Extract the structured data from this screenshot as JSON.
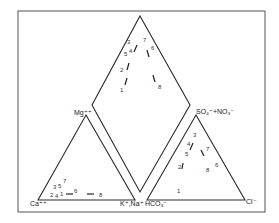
{
  "figure": {
    "type": "Piper trilinear diagram",
    "corner_labels": {
      "cation_left": "Ca⁺⁺",
      "cation_right": "K⁺,Na⁺",
      "cation_apex": "Mg⁺⁺",
      "anion_left": "HCO₃⁻",
      "anion_right": "Cl⁻",
      "anion_apex": "SO₄⁼+NO₃⁻"
    },
    "diamond_points": [
      {
        "label": "1",
        "x": 123,
        "y": 90
      },
      {
        "label": "2",
        "x": 121,
        "y": 70
      },
      {
        "label": "3",
        "x": 128,
        "y": 42
      },
      {
        "label": "5",
        "x": 124,
        "y": 54
      },
      {
        "label": "4",
        "x": 130,
        "y": 52
      },
      {
        "label": "7",
        "x": 145,
        "y": 40
      },
      {
        "label": "6",
        "x": 152,
        "y": 48
      },
      {
        "label": "8",
        "x": 160,
        "y": 87
      }
    ],
    "cation_points": [
      {
        "label": "3",
        "x": 55,
        "y": 187
      },
      {
        "label": "5",
        "x": 60,
        "y": 186
      },
      {
        "label": "7",
        "x": 65,
        "y": 181
      },
      {
        "label": "2",
        "x": 52,
        "y": 195
      },
      {
        "label": "4",
        "x": 57,
        "y": 196
      },
      {
        "label": "1",
        "x": 61,
        "y": 195
      },
      {
        "label": "6",
        "x": 75,
        "y": 193
      },
      {
        "label": "8",
        "x": 101,
        "y": 196
      }
    ],
    "anion_points": [
      {
        "label": "3",
        "x": 194,
        "y": 135
      },
      {
        "label": "4",
        "x": 188,
        "y": 144
      },
      {
        "label": "5",
        "x": 186,
        "y": 154
      },
      {
        "label": "7",
        "x": 207,
        "y": 149
      },
      {
        "label": "2",
        "x": 179,
        "y": 167
      },
      {
        "label": "8",
        "x": 208,
        "y": 170
      },
      {
        "label": "6",
        "x": 216,
        "y": 165
      },
      {
        "label": "1",
        "x": 179,
        "y": 191
      }
    ]
  }
}
